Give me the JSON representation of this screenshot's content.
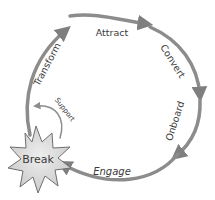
{
  "diagram": {
    "type": "cycle",
    "stages": [
      {
        "id": "attract",
        "label": "Attract"
      },
      {
        "id": "convert",
        "label": "Convert"
      },
      {
        "id": "onboard",
        "label": "Onboard"
      },
      {
        "id": "engage",
        "label": "Engage"
      },
      {
        "id": "transform",
        "label": "Transform"
      }
    ],
    "break_node": {
      "label": "Break"
    },
    "support_arrow": {
      "label": "Support"
    },
    "colors": {
      "arrow": "#8c8c8c",
      "arrowhead": "#7f7f7f",
      "text": "#3a3a3a",
      "star_fill": "#d9d9d9",
      "star_stroke": "#6e6e6e",
      "background": "#ffffff"
    }
  }
}
